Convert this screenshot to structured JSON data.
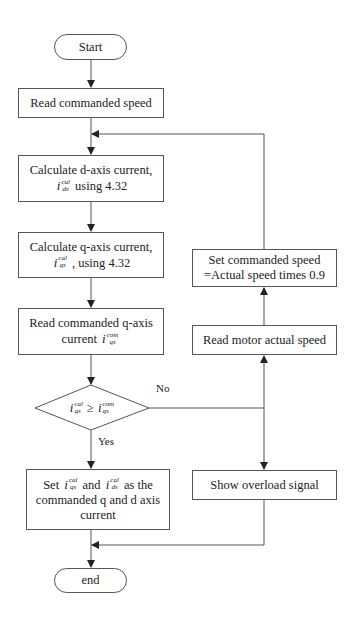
{
  "diagram": {
    "type": "flowchart",
    "nodes": {
      "start": {
        "label": "Start",
        "shape": "terminal"
      },
      "read_speed": {
        "label": "Read commanded speed",
        "shape": "process"
      },
      "calc_d": {
        "line1": "Calculate d-axis current,",
        "var": "i",
        "sup": "cal",
        "sub": "ds",
        "line2_suffix": "using 4.32",
        "shape": "process"
      },
      "calc_q": {
        "line1": "Calculate q-axis current,",
        "var": "i",
        "sup": "cal",
        "sub": "qs",
        "line2_suffix": ", using 4.32",
        "shape": "process"
      },
      "read_q_cmd": {
        "line1": "Read commanded q-axis",
        "line2_prefix": "current",
        "var": "i",
        "sup": "com",
        "sub": "qs",
        "shape": "process"
      },
      "decision": {
        "lhs_var": "i",
        "lhs_sup": "cal",
        "lhs_sub": "qs",
        "op": "≥",
        "rhs_var": "i",
        "rhs_sup": "com",
        "rhs_sub": "qs",
        "shape": "decision"
      },
      "set_currents": {
        "prefix": "Set",
        "a_var": "i",
        "a_sup": "cal",
        "a_sub": "qs",
        "mid": "and",
        "b_var": "i",
        "b_sup": "cal",
        "b_sub": "ds",
        "suffix": "as the",
        "line2": "commanded q and d axis",
        "line3": "current",
        "shape": "process"
      },
      "show_overload": {
        "label": "Show overload signal",
        "shape": "process"
      },
      "read_motor": {
        "label": "Read motor actual speed",
        "shape": "process"
      },
      "set_cmd_speed": {
        "line1": "Set commanded speed",
        "line2": "=Actual speed times 0.9",
        "shape": "process"
      },
      "end": {
        "label": "end",
        "shape": "terminal"
      }
    },
    "edge_labels": {
      "no": "No",
      "yes": "Yes"
    },
    "edges": [
      [
        "start",
        "read_speed"
      ],
      [
        "read_speed",
        "calc_d"
      ],
      [
        "calc_d",
        "calc_q"
      ],
      [
        "calc_q",
        "read_q_cmd"
      ],
      [
        "read_q_cmd",
        "decision"
      ],
      [
        "decision",
        "set_currents",
        "Yes"
      ],
      [
        "decision",
        "show_overload",
        "No"
      ],
      [
        "decision",
        "read_motor",
        "No"
      ],
      [
        "read_motor",
        "set_cmd_speed"
      ],
      [
        "set_cmd_speed",
        "calc_d"
      ],
      [
        "set_currents",
        "end"
      ],
      [
        "show_overload",
        "end"
      ]
    ],
    "colors": {
      "stroke": "#555555",
      "text": "#222222",
      "background": "#ffffff"
    }
  }
}
